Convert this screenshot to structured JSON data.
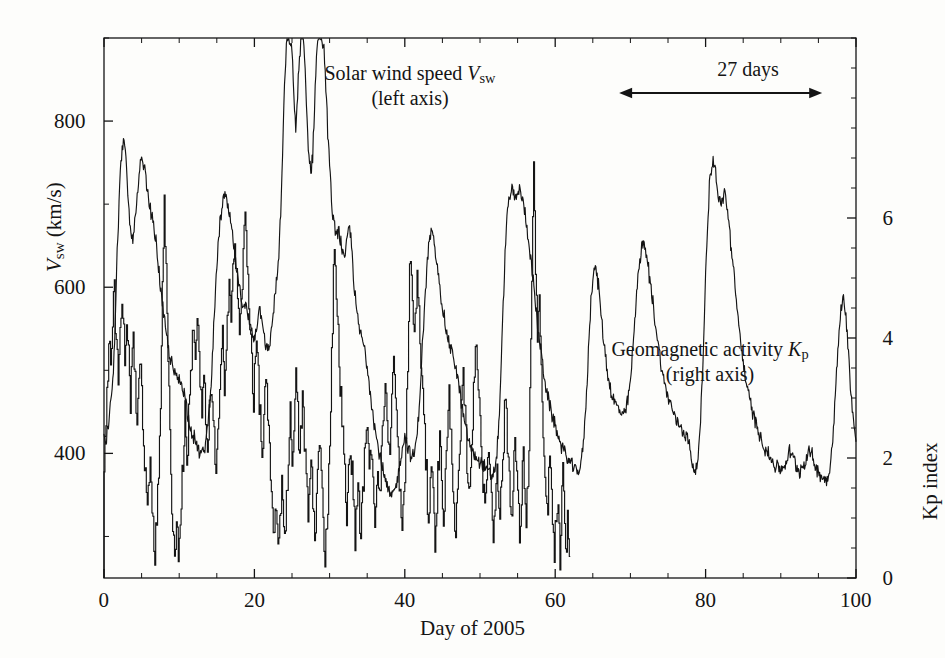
{
  "figure": {
    "background_color": "#fdfdfb",
    "ink_color": "#141414",
    "plot_box": {
      "left": 104,
      "top": 38,
      "right": 856,
      "bottom": 578
    }
  },
  "axes": {
    "x": {
      "title": "Day of 2005",
      "ticks": [
        "0",
        "20",
        "40",
        "60",
        "80",
        "100"
      ],
      "tick_values": [
        0,
        20,
        40,
        60,
        80,
        100
      ],
      "minor_step": 5,
      "range": [
        0,
        100
      ]
    },
    "y_left": {
      "title_parts": {
        "var": "V",
        "sub": "sw",
        "unit": "(km/s)"
      },
      "title": "Vsw (km/s)",
      "ticks": [
        "400",
        "600",
        "800"
      ],
      "tick_values": [
        400,
        600,
        800
      ],
      "minor_step": 100,
      "range": [
        250,
        900
      ]
    },
    "y_right": {
      "title": "Kp index",
      "ticks": [
        "0",
        "2",
        "4",
        "6"
      ],
      "tick_values": [
        0,
        2,
        4,
        6
      ],
      "minor_step": 0.5,
      "range": [
        0,
        9
      ]
    }
  },
  "annotations": {
    "vsw_label": {
      "line1_prefix": "Solar wind speed ",
      "line1_var": "V",
      "line1_sub": "sw",
      "line2": "(left axis)"
    },
    "kp_label": {
      "line1_prefix": "Geomagnetic activity ",
      "line1_var": "K",
      "line1_sub": "p",
      "line2": "(right axis)"
    },
    "recurrence": {
      "text": "27 days",
      "span_days": [
        68.5,
        95.5
      ],
      "arrow": "double-headed"
    }
  },
  "chart_data": {
    "type": "line",
    "title": "",
    "xlabel": "Day of 2005",
    "ylabel": "Vsw (km/s)",
    "y2label": "Kp index",
    "xlim": [
      0,
      100
    ],
    "ylim": [
      250,
      900
    ],
    "y2lim": [
      0,
      9
    ],
    "grid": false,
    "legend": "inline-annotations",
    "series": [
      {
        "name": "Solar wind speed Vsw",
        "axis": "left",
        "units": "km/s",
        "note": "Clipped at top of frame near days 19-23 where speed exceeds 900 km/s",
        "x_step_days": 0.25,
        "x_start": 0,
        "values": [
          412,
          418,
          430,
          455,
          470,
          505,
          560,
          640,
          700,
          755,
          775,
          768,
          740,
          700,
          670,
          655,
          672,
          690,
          712,
          740,
          752,
          748,
          735,
          715,
          700,
          690,
          680,
          665,
          648,
          625,
          600,
          580,
          560,
          545,
          530,
          518,
          508,
          500,
          495,
          490,
          488,
          486,
          480,
          470,
          455,
          443,
          432,
          425,
          418,
          412,
          405,
          400,
          398,
          402,
          412,
          430,
          455,
          490,
          530,
          580,
          625,
          660,
          682,
          700,
          710,
          705,
          695,
          682,
          668,
          650,
          630,
          612,
          598,
          588,
          582,
          578,
          570,
          562,
          552,
          545,
          540,
          552,
          568,
          575,
          565,
          548,
          532,
          520,
          528,
          548,
          570,
          590,
          610,
          640,
          690,
          760,
          840,
          890,
          900,
          900,
          880,
          830,
          790,
          830,
          880,
          900,
          900,
          860,
          800,
          760,
          740,
          760,
          820,
          880,
          900,
          900,
          900,
          890,
          840,
          790,
          745,
          705,
          680,
          665,
          670,
          668,
          655,
          640,
          630,
          650,
          672,
          668,
          640,
          605,
          578,
          560,
          548,
          540,
          532,
          520,
          505,
          488,
          470,
          450,
          432,
          418,
          405,
          395,
          385,
          372,
          362,
          355,
          350,
          348,
          352,
          358,
          368,
          382,
          398,
          412,
          420,
          415,
          405,
          398,
          395,
          400,
          412,
          435,
          470,
          512,
          555,
          595,
          630,
          655,
          668,
          660,
          645,
          628,
          612,
          595,
          578,
          562,
          548,
          538,
          530,
          522,
          515,
          505,
          492,
          478,
          462,
          448,
          435,
          424,
          415,
          408,
          402,
          398,
          395,
          392,
          390,
          388,
          385,
          382,
          378,
          375,
          372,
          375,
          382,
          400,
          435,
          490,
          555,
          620,
          672,
          700,
          712,
          715,
          710,
          705,
          712,
          718,
          712,
          700,
          688,
          672,
          655,
          635,
          612,
          590,
          568,
          548,
          530,
          512,
          496,
          482,
          470,
          458,
          448,
          440,
          432,
          425,
          418,
          412,
          406,
          400,
          396,
          392,
          388,
          385,
          382,
          380,
          378,
          382,
          392,
          412,
          445,
          490,
          540,
          585,
          612,
          625,
          618,
          600,
          578,
          555,
          532,
          512,
          495,
          482,
          472,
          465,
          460,
          456,
          452,
          448,
          445,
          448,
          455,
          468,
          488,
          515,
          548,
          582,
          612,
          635,
          648,
          652,
          645,
          632,
          615,
          598,
          580,
          562,
          545,
          528,
          512,
          498,
          486,
          476,
          468,
          462,
          455,
          448,
          442,
          438,
          435,
          432,
          428,
          425,
          420,
          412,
          400,
          388,
          380,
          382,
          395,
          425,
          475,
          540,
          612,
          675,
          720,
          745,
          752,
          742,
          725,
          708,
          695,
          705,
          715,
          705,
          685,
          662,
          638,
          615,
          592,
          570,
          548,
          528,
          510,
          494,
          480,
          468,
          458,
          450,
          442,
          435,
          428,
          422,
          416,
          410,
          405,
          400,
          396,
          392,
          388,
          386,
          384,
          382,
          380,
          382,
          386,
          392,
          398,
          402,
          398,
          392,
          386,
          382,
          380,
          382,
          386,
          392,
          398,
          402,
          400,
          394,
          388,
          382,
          378,
          375,
          372,
          370,
          368,
          372,
          382,
          400,
          430,
          470,
          510,
          545,
          572,
          590,
          580,
          555,
          520,
          485,
          455,
          432,
          415,
          402,
          392,
          384,
          378,
          372,
          368,
          364,
          360,
          356,
          352,
          350,
          348,
          350,
          358,
          375,
          405,
          455,
          520,
          585,
          640,
          675,
          688,
          682,
          668,
          650,
          630,
          608,
          585,
          562,
          540,
          520,
          502,
          488,
          478,
          470,
          462,
          455,
          448,
          442,
          438,
          435,
          432,
          430,
          428,
          428,
          430,
          435,
          442,
          452,
          465,
          480,
          498,
          518,
          542,
          570,
          598,
          620,
          634,
          630,
          615,
          592,
          565,
          535,
          508,
          482,
          460,
          442,
          428,
          415,
          404,
          395,
          388,
          382,
          376,
          372,
          368,
          364,
          360,
          356,
          352,
          348,
          345,
          342,
          340,
          338,
          336,
          335,
          334,
          333,
          332,
          331
        ]
      },
      {
        "name": "Geomagnetic activity Kp",
        "axis": "right",
        "units": "index",
        "resolution": "3-hourly",
        "x_step_days": 0.125,
        "x_start": 0,
        "values": [
          2.0,
          2.3,
          2.7,
          3.0,
          3.3,
          3.7,
          4.0,
          3.7,
          4.0,
          4.3,
          4.7,
          5.0,
          4.3,
          4.0,
          3.7,
          3.3,
          3.7,
          4.0,
          4.3,
          4.7,
          4.3,
          4.0,
          3.7,
          4.0,
          4.3,
          4.0,
          3.7,
          3.3,
          3.0,
          3.3,
          3.7,
          4.0,
          3.7,
          3.3,
          3.0,
          2.7,
          3.0,
          3.3,
          3.7,
          3.3,
          3.0,
          2.7,
          2.3,
          2.0,
          1.7,
          1.3,
          1.0,
          1.3,
          1.7,
          2.0,
          1.7,
          1.3,
          1.0,
          0.7,
          0.3,
          0.7,
          1.0,
          1.3,
          1.7,
          2.3,
          3.0,
          4.0,
          5.0,
          5.7,
          6.3,
          5.7,
          5.0,
          4.3,
          3.7,
          3.0,
          2.3,
          1.7,
          1.3,
          1.0,
          0.7,
          0.3,
          0.7,
          1.0,
          0.7,
          0.3,
          0.7,
          1.0,
          1.3,
          1.7,
          2.0,
          2.3,
          2.7,
          2.3,
          2.0,
          2.3,
          2.7,
          3.0,
          3.3,
          3.7,
          4.0,
          4.3,
          4.0,
          3.7,
          4.0,
          4.3,
          4.0,
          3.7,
          3.3,
          3.0,
          2.7,
          3.0,
          3.3,
          3.0,
          2.7,
          2.3,
          2.0,
          2.3,
          2.7,
          3.0,
          3.3,
          3.0,
          2.7,
          2.3,
          2.0,
          1.7,
          2.0,
          2.3,
          2.7,
          3.0,
          3.3,
          3.7,
          4.0,
          3.7,
          3.3,
          3.7,
          4.0,
          4.3,
          4.7,
          5.0,
          4.7,
          4.3,
          4.7,
          5.0,
          5.3,
          5.7,
          5.3,
          5.0,
          4.7,
          4.3,
          4.0,
          4.3,
          4.7,
          5.0,
          5.3,
          5.7,
          6.0,
          5.7,
          5.3,
          5.0,
          4.7,
          4.3,
          4.0,
          3.7,
          3.3,
          3.0,
          3.3,
          3.7,
          4.0,
          3.7,
          3.3,
          3.0,
          2.7,
          2.3,
          2.0,
          2.3,
          2.7,
          3.0,
          3.3,
          3.0,
          2.7,
          2.3,
          2.0,
          1.7,
          1.3,
          1.0,
          0.7,
          1.0,
          1.3,
          1.0,
          0.7,
          0.3,
          0.7,
          1.0,
          1.3,
          1.7,
          1.3,
          1.0,
          0.7,
          1.0,
          1.3,
          1.7,
          2.0,
          2.3,
          2.7,
          2.3,
          2.0,
          2.3,
          2.7,
          3.0,
          3.3,
          3.0,
          2.7,
          2.3,
          2.0,
          2.3,
          2.7,
          3.0,
          2.7,
          2.3,
          2.0,
          1.7,
          1.3,
          1.0,
          1.3,
          1.7,
          2.0,
          1.7,
          1.3,
          1.0,
          0.7,
          1.0,
          1.3,
          1.7,
          2.0,
          2.3,
          2.0,
          1.7,
          1.3,
          1.0,
          0.7,
          0.3,
          0.7,
          1.0,
          1.3,
          1.7,
          2.3,
          3.0,
          3.7,
          4.3,
          5.0,
          5.7,
          5.3,
          4.7,
          4.3,
          4.0,
          3.7,
          3.3,
          3.0,
          2.7,
          2.3,
          2.0,
          1.7,
          1.3,
          1.0,
          1.3,
          1.7,
          2.0,
          2.3,
          2.0,
          1.7,
          1.3,
          1.0,
          0.7,
          1.0,
          1.3,
          1.7,
          1.3,
          1.0,
          0.7,
          1.0,
          1.3,
          1.7,
          2.0,
          2.3,
          2.7,
          2.3,
          2.0,
          1.7,
          2.0,
          2.3,
          2.0,
          1.7,
          1.3,
          1.0,
          1.3,
          1.7,
          2.0,
          1.7,
          1.3,
          1.7,
          2.0,
          2.3,
          2.7,
          3.0,
          3.3,
          3.0,
          2.7,
          2.3,
          2.0,
          2.3,
          2.7,
          3.0,
          3.3,
          3.7,
          3.3,
          3.0,
          2.7,
          2.3,
          2.0,
          1.7,
          1.3,
          1.0,
          0.7,
          1.0,
          1.3,
          1.7,
          2.3,
          3.0,
          3.7,
          4.3,
          5.0,
          5.3,
          5.0,
          4.7,
          4.3,
          4.0,
          4.3,
          4.7,
          5.0,
          4.7,
          4.3,
          4.0,
          3.7,
          3.3,
          3.0,
          2.7,
          2.3,
          2.0,
          1.7,
          1.3,
          1.0,
          1.3,
          1.7,
          2.0,
          1.7,
          1.3,
          1.0,
          0.7,
          1.0,
          1.3,
          1.7,
          2.0,
          2.3,
          2.0,
          1.7,
          1.3,
          1.0,
          1.3,
          1.7,
          2.0,
          2.3,
          2.7,
          3.0,
          2.7,
          2.3,
          2.0,
          1.7,
          1.3,
          1.0,
          0.7,
          1.0,
          1.3,
          1.7,
          2.0,
          2.3,
          2.7,
          3.0,
          3.3,
          3.0,
          2.7,
          2.3,
          2.0,
          1.7,
          1.3,
          1.7,
          2.0,
          2.3,
          2.7,
          3.0,
          3.3,
          3.7,
          4.0,
          3.7,
          3.3,
          3.0,
          2.7,
          2.3,
          2.0,
          1.7,
          1.3,
          1.0,
          1.3,
          1.7,
          2.0,
          2.3,
          2.0,
          1.7,
          1.3,
          1.0,
          0.7,
          1.0,
          1.3,
          1.7,
          2.0,
          1.7,
          1.3,
          1.0,
          1.3,
          1.7,
          2.0,
          2.3,
          2.7,
          3.0,
          2.7,
          2.3,
          2.0,
          1.7,
          1.3,
          1.0,
          1.3,
          1.7,
          2.0,
          2.3,
          2.0,
          1.7,
          1.3,
          1.0,
          0.7,
          1.0,
          1.3,
          1.7,
          2.0,
          1.7,
          1.3,
          1.0,
          1.3,
          1.7,
          2.3,
          3.0,
          4.0,
          5.0,
          6.0,
          6.7,
          6.0,
          5.3,
          4.7,
          4.0,
          4.3,
          4.7,
          4.0,
          3.3,
          2.7,
          2.3,
          2.0,
          1.7,
          1.3,
          1.0,
          1.3,
          1.7,
          2.0,
          1.7,
          1.3,
          1.0,
          0.7,
          0.3,
          0.7,
          1.0,
          1.3,
          1.0,
          0.7,
          0.3,
          0.7,
          1.3,
          1.7,
          1.3,
          0.7,
          0.3,
          0.7,
          1.0,
          0.7,
          0.3
        ]
      }
    ]
  }
}
